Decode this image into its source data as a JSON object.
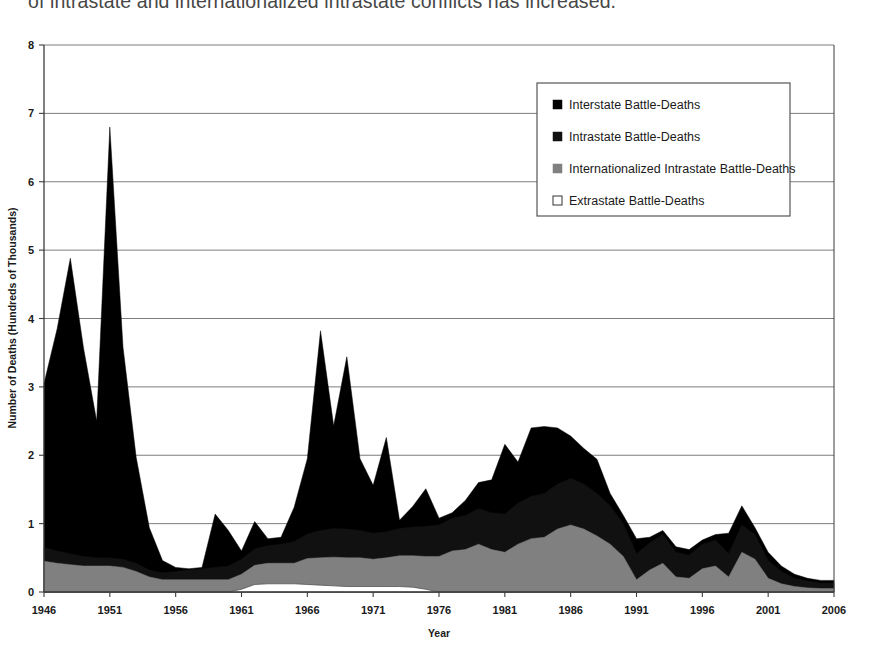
{
  "caption": {
    "text": "of intrastate and internationalized intrastate conflicts has increased."
  },
  "colors": {
    "interstate": "#000000",
    "intrastate": "#111111",
    "internationalized_intrastate": "#808080",
    "extrastate": "#ffffff",
    "axis": "#3c3c3c",
    "gridline": "#6e6e6e",
    "text": "#1a1a1a",
    "legend_border": "#555555",
    "plot_background": "#ffffff"
  },
  "legend": {
    "position": "top-right-inside",
    "entries": [
      {
        "label": "Interstate Battle-Deaths",
        "marker": "filled-square-black",
        "color": "#000000"
      },
      {
        "label": "Intrastate Battle-Deaths",
        "marker": "filled-square-black",
        "color": "#111111"
      },
      {
        "label": "Internationalized Intrastate Battle-Deaths",
        "marker": "filled-square-gray",
        "color": "#808080"
      },
      {
        "label": "Extrastate Battle-Deaths",
        "marker": "open-square-white",
        "color": "#ffffff"
      }
    ]
  },
  "chart_data": {
    "type": "area",
    "stacked": true,
    "title": "",
    "xlabel": "Year",
    "ylabel": "Number of Deaths (Hundreds of Thousands)",
    "xlim": [
      1946,
      2006
    ],
    "ylim": [
      0,
      8
    ],
    "xticks": [
      1946,
      1951,
      1956,
      1961,
      1966,
      1971,
      1976,
      1981,
      1986,
      1991,
      1996,
      2001,
      2006
    ],
    "yticks": [
      0,
      1,
      2,
      3,
      4,
      5,
      6,
      7,
      8
    ],
    "xtick_labels": [
      "1946",
      "1951",
      "1956",
      "1961",
      "1966",
      "1971",
      "1976",
      "1981",
      "1986",
      "1991",
      "1996",
      "2001",
      "2006"
    ],
    "ytick_labels": [
      "0",
      "1",
      "2",
      "3",
      "4",
      "5",
      "6",
      "7",
      "8"
    ],
    "grid": {
      "horizontal": true,
      "vertical": false
    },
    "x": [
      1946,
      1947,
      1948,
      1949,
      1950,
      1951,
      1952,
      1953,
      1954,
      1955,
      1956,
      1957,
      1958,
      1959,
      1960,
      1961,
      1962,
      1963,
      1964,
      1965,
      1966,
      1967,
      1968,
      1969,
      1970,
      1971,
      1972,
      1973,
      1974,
      1975,
      1976,
      1977,
      1978,
      1979,
      1980,
      1981,
      1982,
      1983,
      1984,
      1985,
      1986,
      1987,
      1988,
      1989,
      1990,
      1991,
      1992,
      1993,
      1994,
      1995,
      1996,
      1997,
      1998,
      1999,
      2000,
      2001,
      2002,
      2003,
      2004,
      2005,
      2006
    ],
    "series": [
      {
        "name": "Extrastate Battle-Deaths",
        "color": "#ffffff",
        "stack_order": 1,
        "values": [
          0.0,
          0.0,
          0.0,
          0.0,
          0.0,
          0.0,
          0.0,
          0.0,
          0.0,
          0.0,
          0.0,
          0.0,
          0.0,
          0.0,
          0.0,
          0.04,
          0.11,
          0.12,
          0.12,
          0.12,
          0.11,
          0.1,
          0.09,
          0.08,
          0.08,
          0.08,
          0.08,
          0.08,
          0.07,
          0.04,
          0.0,
          0.0,
          0.0,
          0.0,
          0.0,
          0.0,
          0.0,
          0.0,
          0.0,
          0.0,
          0.0,
          0.0,
          0.0,
          0.0,
          0.0,
          0.0,
          0.0,
          0.0,
          0.0,
          0.0,
          0.0,
          0.0,
          0.0,
          0.0,
          0.0,
          0.0,
          0.0,
          0.0,
          0.0,
          0.0,
          0.0
        ]
      },
      {
        "name": "Internationalized Intrastate Battle-Deaths",
        "color": "#808080",
        "stack_order": 2,
        "values": [
          0.45,
          0.42,
          0.4,
          0.38,
          0.38,
          0.38,
          0.36,
          0.3,
          0.22,
          0.18,
          0.18,
          0.18,
          0.18,
          0.18,
          0.18,
          0.22,
          0.28,
          0.3,
          0.3,
          0.3,
          0.38,
          0.4,
          0.42,
          0.42,
          0.42,
          0.4,
          0.42,
          0.45,
          0.46,
          0.48,
          0.52,
          0.6,
          0.62,
          0.7,
          0.62,
          0.58,
          0.7,
          0.78,
          0.8,
          0.92,
          0.98,
          0.92,
          0.82,
          0.7,
          0.52,
          0.18,
          0.32,
          0.42,
          0.22,
          0.2,
          0.34,
          0.38,
          0.22,
          0.58,
          0.48,
          0.2,
          0.12,
          0.08,
          0.06,
          0.05,
          0.05
        ]
      },
      {
        "name": "Intrastate Battle-Deaths",
        "color": "#111111",
        "stack_order": 3,
        "values": [
          0.2,
          0.18,
          0.16,
          0.14,
          0.12,
          0.12,
          0.12,
          0.12,
          0.1,
          0.1,
          0.12,
          0.14,
          0.16,
          0.18,
          0.2,
          0.22,
          0.24,
          0.26,
          0.28,
          0.32,
          0.36,
          0.4,
          0.42,
          0.42,
          0.4,
          0.38,
          0.38,
          0.4,
          0.42,
          0.44,
          0.46,
          0.48,
          0.5,
          0.52,
          0.54,
          0.56,
          0.6,
          0.62,
          0.64,
          0.66,
          0.68,
          0.66,
          0.62,
          0.56,
          0.48,
          0.38,
          0.4,
          0.42,
          0.36,
          0.34,
          0.36,
          0.38,
          0.34,
          0.4,
          0.36,
          0.26,
          0.18,
          0.12,
          0.1,
          0.08,
          0.08
        ]
      },
      {
        "name": "Interstate Battle-Deaths",
        "color": "#000000",
        "stack_order": 4,
        "values": [
          2.4,
          3.25,
          4.32,
          3.05,
          2.0,
          6.3,
          3.1,
          1.55,
          0.62,
          0.18,
          0.06,
          0.02,
          0.02,
          0.78,
          0.52,
          0.12,
          0.4,
          0.1,
          0.1,
          0.5,
          1.1,
          2.92,
          1.5,
          2.52,
          1.05,
          0.7,
          1.38,
          0.12,
          0.3,
          0.55,
          0.1,
          0.08,
          0.22,
          0.38,
          0.48,
          1.02,
          0.6,
          1.0,
          0.98,
          0.82,
          0.62,
          0.52,
          0.5,
          0.18,
          0.12,
          0.22,
          0.08,
          0.06,
          0.08,
          0.08,
          0.06,
          0.08,
          0.3,
          0.28,
          0.1,
          0.12,
          0.08,
          0.06,
          0.04,
          0.04,
          0.04
        ]
      }
    ],
    "totals_note": "Stacked totals peak at about 6.8 in 1951 and about 4.9 in 1948.",
    "annotations": []
  }
}
